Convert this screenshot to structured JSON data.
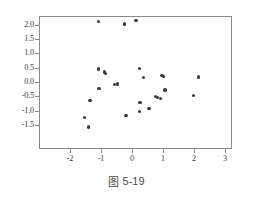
{
  "caption": {
    "symbol": "图",
    "text": "5-19",
    "full": "图 5-19"
  },
  "axes": {
    "x_ticks": [
      "-2",
      "-1",
      "0",
      "1",
      "2",
      "3"
    ],
    "x_tick_values": [
      -2,
      -1,
      0,
      1,
      2,
      3
    ],
    "y_ticks": [
      "2.0",
      "1.5",
      "1.0",
      "0.5",
      "0.0",
      "-0.5",
      "-1.0",
      "-1.5"
    ],
    "y_tick_values": [
      2.0,
      1.5,
      1.0,
      0.5,
      0.0,
      -0.5,
      -1.0,
      -1.5
    ],
    "frame_color": "#8a8a8a",
    "point_color": "#3b3b3b"
  },
  "chart_data": {
    "type": "scatter",
    "title": "",
    "xlabel": "",
    "ylabel": "",
    "xlim": [
      -2.55,
      3.25
    ],
    "ylim": [
      -1.8,
      2.45
    ],
    "grid": false,
    "legend": null,
    "marker": "filled-circle",
    "series": [
      {
        "name": "observations",
        "points": [
          [
            -1.11,
            2.14
          ],
          [
            -0.28,
            2.06
          ],
          [
            0.1,
            2.17
          ],
          [
            -1.11,
            0.49
          ],
          [
            -0.92,
            0.38
          ],
          [
            -0.89,
            0.33
          ],
          [
            -1.1,
            -0.2
          ],
          [
            -0.59,
            -0.06
          ],
          [
            -0.5,
            -0.03
          ],
          [
            0.21,
            0.5
          ],
          [
            0.34,
            0.19
          ],
          [
            0.94,
            0.26
          ],
          [
            0.98,
            0.23
          ],
          [
            1.03,
            -0.25
          ],
          [
            2.11,
            0.21
          ],
          [
            1.95,
            -0.43
          ],
          [
            0.73,
            -0.48
          ],
          [
            0.79,
            -0.51
          ],
          [
            0.88,
            -0.54
          ],
          [
            0.23,
            -0.67
          ],
          [
            0.52,
            -0.89
          ],
          [
            0.21,
            -1.0
          ],
          [
            -0.23,
            -1.14
          ],
          [
            -1.39,
            -0.6
          ],
          [
            -1.56,
            -1.2
          ],
          [
            -1.44,
            -1.53
          ]
        ]
      }
    ]
  }
}
